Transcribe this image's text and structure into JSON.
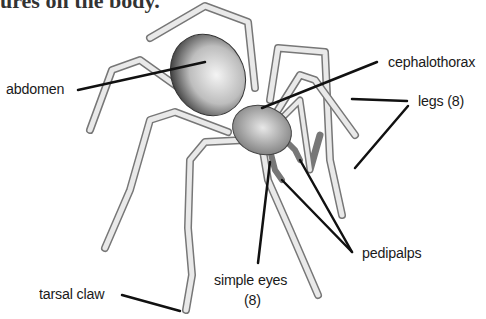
{
  "diagram": {
    "type": "labeled-illustration",
    "caption_fragment": "ures on the body.",
    "labels": {
      "abdomen": "abdomen",
      "cephalothorax": "cephalothorax",
      "legs": "legs (8)",
      "pedipalps": "pedipalps",
      "simple_eyes_line1": "simple eyes",
      "simple_eyes_line2": "(8)",
      "tarsal_claw": "tarsal claw"
    },
    "colors": {
      "background": "#ffffff",
      "leader_line": "#111111",
      "text": "#1a1a1a",
      "body_shade": "#555555",
      "leg_fill": "#e6e6e6"
    }
  }
}
